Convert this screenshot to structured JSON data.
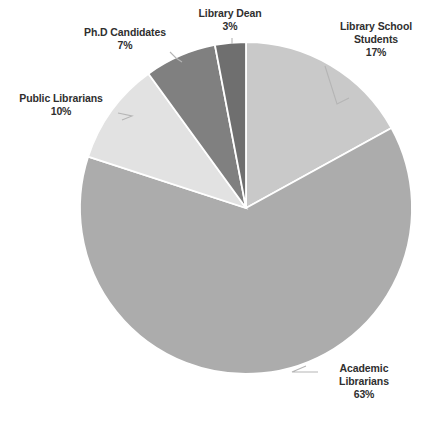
{
  "chart_data": {
    "type": "pie",
    "title": "",
    "subtitle": "",
    "xlabel": "",
    "ylabel": "",
    "legend_position": "none",
    "grid": false,
    "labels_show_percent": true,
    "start_angle_deg": 0,
    "direction": "clockwise",
    "categories": [
      "Library School Students",
      "Academic Librarians",
      "Public Librarians",
      "Ph.D Candidates",
      "Library Dean"
    ],
    "values": [
      17,
      63,
      10,
      7,
      3
    ],
    "value_labels": [
      "17%",
      "63%",
      "10%",
      "7%",
      "3%"
    ],
    "colors": [
      "#c9c9c9",
      "#acacac",
      "#e2e2e2",
      "#808080",
      "#6f6f6f"
    ],
    "slices": [
      {
        "name": "Library School Students",
        "value": 17,
        "value_label": "17%",
        "color": "#c9c9c9",
        "start_deg": 0,
        "end_deg": 61.2,
        "label_lines": [
          "Library School",
          "Students"
        ]
      },
      {
        "name": "Academic Librarians",
        "value": 63,
        "value_label": "63%",
        "color": "#acacac",
        "start_deg": 61.2,
        "end_deg": 288,
        "label_lines": [
          "Academic",
          "Librarians"
        ]
      },
      {
        "name": "Public Librarians",
        "value": 10,
        "value_label": "10%",
        "color": "#e2e2e2",
        "start_deg": 288,
        "end_deg": 324,
        "label_lines": [
          "Public Librarians"
        ]
      },
      {
        "name": "Ph.D Candidates",
        "value": 7,
        "value_label": "7%",
        "color": "#808080",
        "start_deg": 324,
        "end_deg": 349.2,
        "label_lines": [
          "Ph.D Candidates"
        ]
      },
      {
        "name": "Library Dean",
        "value": 3,
        "value_label": "3%",
        "color": "#6f6f6f",
        "start_deg": 349.2,
        "end_deg": 360,
        "label_lines": [
          "Library Dean"
        ]
      }
    ]
  },
  "labels": {
    "library_dean": {
      "name": "Library Dean",
      "percent": "3%"
    },
    "library_school_students": {
      "line1": "Library School",
      "line2": "Students",
      "percent": "17%"
    },
    "phd_candidates": {
      "name": "Ph.D Candidates",
      "percent": "7%"
    },
    "public_librarians": {
      "name": "Public Librarians",
      "percent": "10%"
    },
    "academic_librarians": {
      "line1": "Academic",
      "line2": "Librarians",
      "percent": "63%"
    }
  },
  "style": {
    "background": "#ffffff",
    "text_color": "#2f2f2f",
    "slice_border": "#ffffff",
    "leader_line_color": "#b5b5b5"
  }
}
